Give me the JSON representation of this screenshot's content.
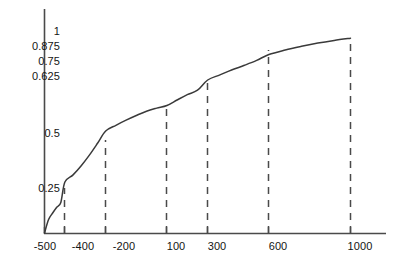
{
  "chart_data": {
    "type": "line",
    "title": "",
    "subtitle": "",
    "xlabel": "",
    "ylabel": "",
    "xlim": [
      -500,
      1060
    ],
    "ylim": [
      0,
      1.06
    ],
    "grid": false,
    "legend": null,
    "line_color": "#3a3a3a",
    "axis_color": "#4a4a4a",
    "dash_color": "#4a4a4a",
    "background": "#ffffff",
    "x_tick_labels": [
      "-500",
      "-400",
      "-200",
      "100",
      "300",
      "600",
      "1000"
    ],
    "x_tick_values": [
      -500,
      -400,
      -200,
      100,
      300,
      600,
      1000
    ],
    "y_tick_labels": [
      "0.25",
      "0.5",
      "0.625",
      "0.75",
      "0.875",
      "1"
    ],
    "y_tick_values": [
      0.25,
      0.5,
      0.625,
      0.75,
      0.875,
      1
    ],
    "reference_lines": [
      {
        "x": -400,
        "y": 0.25,
        "style": "dashed"
      },
      {
        "x": -200,
        "y": 0.5,
        "style": "dashed"
      },
      {
        "x": 100,
        "y": 0.625,
        "style": "dashed"
      },
      {
        "x": 300,
        "y": 0.75,
        "style": "dashed"
      },
      {
        "x": 600,
        "y": 0.875,
        "style": "dashed"
      },
      {
        "x": 1000,
        "y": 0.955,
        "style": "dashed"
      }
    ],
    "x": [
      -500,
      -480,
      -460,
      -440,
      -420,
      -400,
      -360,
      -320,
      -280,
      -240,
      -200,
      -150,
      -100,
      -50,
      0,
      50,
      100,
      150,
      200,
      250,
      300,
      360,
      420,
      480,
      540,
      600,
      680,
      760,
      840,
      920,
      1000
    ],
    "y": [
      0,
      0.066,
      0.098,
      0.126,
      0.15,
      0.25,
      0.285,
      0.33,
      0.382,
      0.44,
      0.5,
      0.528,
      0.553,
      0.576,
      0.597,
      0.612,
      0.625,
      0.652,
      0.678,
      0.7,
      0.75,
      0.775,
      0.8,
      0.822,
      0.846,
      0.875,
      0.897,
      0.915,
      0.931,
      0.944,
      0.955
    ],
    "series": [
      {
        "name": "curve",
        "values": [
          0,
          0.066,
          0.098,
          0.126,
          0.15,
          0.25,
          0.285,
          0.33,
          0.382,
          0.44,
          0.5,
          0.528,
          0.553,
          0.576,
          0.597,
          0.612,
          0.625,
          0.652,
          0.678,
          0.7,
          0.75,
          0.775,
          0.8,
          0.822,
          0.846,
          0.875,
          0.897,
          0.915,
          0.931,
          0.944,
          0.955
        ]
      }
    ]
  },
  "axes": {
    "y_ticks": [
      {
        "label": "1",
        "value": 1
      },
      {
        "label": "0.875",
        "value": 0.875
      },
      {
        "label": "0.75",
        "value": 0.75
      },
      {
        "label": "0.625",
        "value": 0.625
      },
      {
        "label": "0.5",
        "value": 0.5
      },
      {
        "label": "0.25",
        "value": 0.25
      }
    ],
    "x_ticks": [
      {
        "label": "-500",
        "value": -500
      },
      {
        "label": "-400",
        "value": -400
      },
      {
        "label": "-200",
        "value": -200
      },
      {
        "label": "100",
        "value": 100
      },
      {
        "label": "300",
        "value": 300
      },
      {
        "label": "600",
        "value": 600
      },
      {
        "label": "1000",
        "value": 1000
      }
    ]
  }
}
